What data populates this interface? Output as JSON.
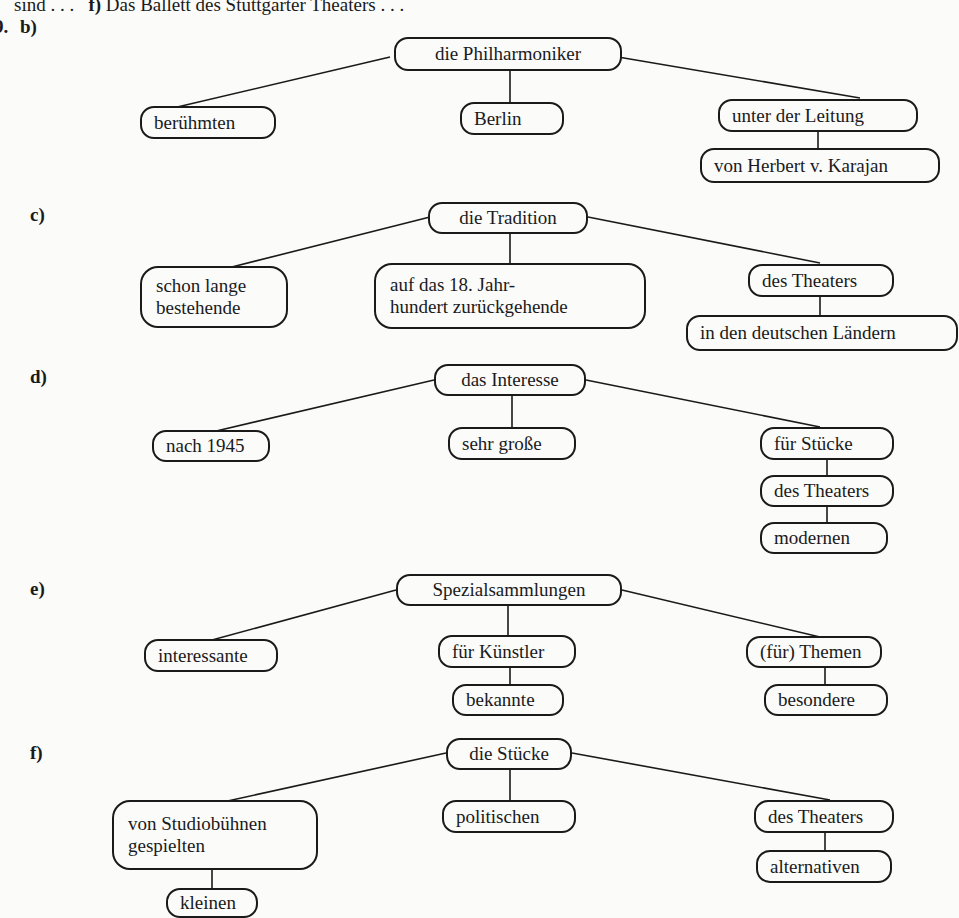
{
  "header": {
    "prefix": "sind . . .",
    "item_label": "f)",
    "item_text": "Das Ballett des Stuttgarter Theaters . . ."
  },
  "exercise_number_fragment": "9.",
  "diagrams": {
    "b": {
      "label": "b)",
      "root": "die Philharmoniker",
      "children": [
        "berühmten",
        "Berlin",
        "unter der Leitung"
      ],
      "sub": [
        "von Herbert v. Karajan"
      ]
    },
    "c": {
      "label": "c)",
      "root": "die Tradition",
      "children": [
        "schon lange bestehende",
        "auf das 18. Jahr-hundert zurückgehende",
        "des Theaters"
      ],
      "children_lines": [
        [
          "schon lange",
          "bestehende"
        ],
        [
          "auf das 18. Jahr-",
          "hundert zurückgehende"
        ]
      ],
      "sub": [
        "in den deutschen Ländern"
      ]
    },
    "d": {
      "label": "d)",
      "root": "das Interesse",
      "children": [
        "nach 1945",
        "sehr große",
        "für Stücke"
      ],
      "sub": [
        "des Theaters",
        "modernen"
      ]
    },
    "e": {
      "label": "e)",
      "root": "Spezialsammlungen",
      "children": [
        "interessante",
        "für Künstler",
        "(für) Themen"
      ],
      "sub_middle": [
        "bekannte"
      ],
      "sub_right": [
        "besondere"
      ]
    },
    "f": {
      "label": "f)",
      "root": "die Stücke",
      "children": [
        "von Studiobühnen gespielten",
        "politischen",
        "des Theaters"
      ],
      "children_lines": [
        [
          "von Studiobühnen",
          "gespielten"
        ]
      ],
      "sub_left": [
        "kleinen"
      ],
      "sub_right": [
        "alternativen"
      ]
    }
  }
}
